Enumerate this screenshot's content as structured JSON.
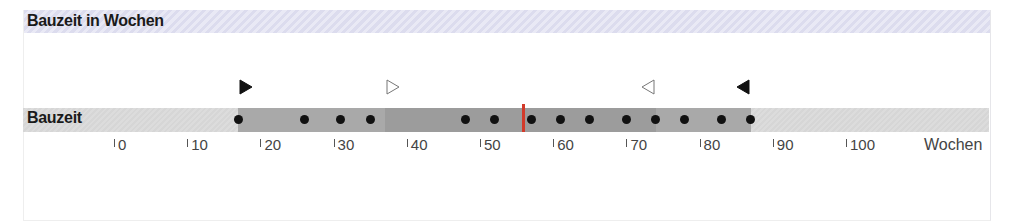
{
  "header": {
    "title": "Bauzeit in Wochen"
  },
  "row": {
    "label": "Bauzeit"
  },
  "axis": {
    "unit_label": "Wochen",
    "ticks": [
      "0",
      "10",
      "20",
      "30",
      "40",
      "50",
      "60",
      "70",
      "80",
      "90",
      "100"
    ]
  },
  "colors": {
    "median": "#d23a2a",
    "outer_band": "#a9a9a9",
    "inner_band": "#9c9c9c",
    "track": "#d8d8d8",
    "header_bg": "#e2e2f1",
    "dot": "#111111"
  },
  "chart_data": {
    "type": "scatter",
    "title": "Bauzeit in Wochen",
    "xlabel": "Wochen",
    "ylabel": "",
    "categories": [
      "Bauzeit"
    ],
    "xlim": [
      -16,
      119
    ],
    "xticks": [
      0,
      10,
      20,
      30,
      40,
      50,
      60,
      70,
      80,
      90,
      100
    ],
    "grid": false,
    "points": [
      17,
      26,
      31,
      35,
      48,
      52,
      57,
      61,
      65,
      70,
      74,
      78,
      83,
      87
    ],
    "median": 56,
    "min_marker": 17,
    "q1_marker": 37,
    "q3_marker": 74,
    "max_marker": 87,
    "bands": [
      {
        "name": "range",
        "from": 17,
        "to": 87
      },
      {
        "name": "interquartile",
        "from": 37,
        "to": 74
      }
    ],
    "legend": []
  }
}
